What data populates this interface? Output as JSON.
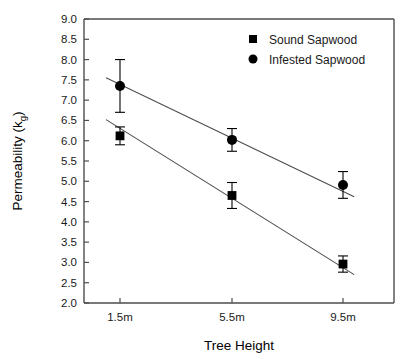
{
  "chart_data": {
    "type": "scatter",
    "title": "",
    "subtitle": "",
    "xlabel": "Tree Height",
    "ylabel": "Permeability (kg)",
    "ylabel_base": "Permeability (k",
    "ylabel_sub": "g",
    "ylabel_close": ")",
    "categories": [
      "1.5m",
      "5.5m",
      "9.5m"
    ],
    "xlim": [
      0,
      4
    ],
    "ylim": [
      2.0,
      9.0
    ],
    "ytick_step": 0.5,
    "yticks": [
      "9.0",
      "8.5",
      "8.0",
      "7.5",
      "7.0",
      "6.5",
      "6.0",
      "5.5",
      "5.0",
      "4.5",
      "4.0",
      "3.5",
      "3.0",
      "2.5",
      "2.0"
    ],
    "ytick_values": [
      9.0,
      8.5,
      8.0,
      7.5,
      7.0,
      6.5,
      6.0,
      5.5,
      5.0,
      4.5,
      4.0,
      3.5,
      3.0,
      2.5,
      2.0
    ],
    "grid": false,
    "legend_position": "top-right",
    "marker_color": "#000000",
    "line_color": "#4d4d4d",
    "axis_color": "#4d4d4d",
    "series": [
      {
        "name": "Sound Sapwood",
        "marker": "square",
        "values": [
          6.12,
          4.65,
          2.96
        ],
        "errors": [
          0.22,
          0.32,
          0.2
        ],
        "fit_line": {
          "x_start": 1.0,
          "y_start": 6.52,
          "x_end": 9.9,
          "y_end": 2.7
        }
      },
      {
        "name": "Infested Sapwood",
        "marker": "circle",
        "values": [
          7.35,
          6.02,
          4.91
        ],
        "errors": [
          0.65,
          0.28,
          0.33
        ],
        "fit_line": {
          "x_start": 1.0,
          "y_start": 7.55,
          "x_end": 9.9,
          "y_end": 4.62
        }
      }
    ]
  },
  "legend": {
    "items": [
      {
        "label": "Sound Sapwood",
        "marker": "square"
      },
      {
        "label": "Infested Sapwood",
        "marker": "circle"
      }
    ]
  }
}
